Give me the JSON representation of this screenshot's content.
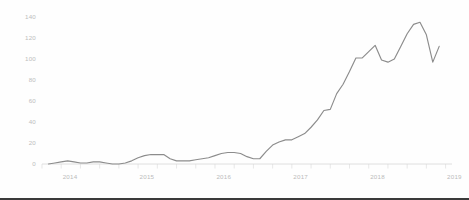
{
  "chart_data": {
    "type": "line",
    "title": "",
    "subtitle": "",
    "xlabel": "",
    "ylabel": "",
    "grid": false,
    "legend": null,
    "legend_position": "none",
    "line_color": "#8c8c8c",
    "axis_color": "#d8d8d8",
    "label_color": "#bdbdbd",
    "background_color": "#fefefe",
    "ylim": [
      0,
      145
    ],
    "ytick_values": [
      0,
      20,
      40,
      60,
      80,
      100,
      120,
      140
    ],
    "ytick_labels": [
      "0",
      "20",
      "40",
      "60",
      "80",
      "100",
      "120",
      "140"
    ],
    "xlim": [
      "2013-10",
      "2019-02"
    ],
    "xtick_labels": [
      "2014",
      "2015",
      "2016",
      "2017",
      "2018",
      "2019"
    ],
    "xtick_x": [
      "2014-01",
      "2015-01",
      "2016-01",
      "2017-01",
      "2018-01",
      "2019-01"
    ],
    "minor_tick_interval_months": 3,
    "x": [
      "2013-11",
      "2013-12",
      "2014-01",
      "2014-02",
      "2014-03",
      "2014-04",
      "2014-05",
      "2014-06",
      "2014-07",
      "2014-08",
      "2014-09",
      "2014-10",
      "2014-11",
      "2014-12",
      "2015-01",
      "2015-02",
      "2015-03",
      "2015-04",
      "2015-05",
      "2015-06",
      "2015-07",
      "2015-08",
      "2015-09",
      "2015-10",
      "2015-11",
      "2015-12",
      "2016-01",
      "2016-02",
      "2016-03",
      "2016-04",
      "2016-05",
      "2016-06",
      "2016-07",
      "2016-08",
      "2016-09",
      "2016-10",
      "2016-11",
      "2016-12",
      "2017-01",
      "2017-02",
      "2017-03",
      "2017-04",
      "2017-05",
      "2017-06",
      "2017-07",
      "2017-08",
      "2017-09",
      "2017-10",
      "2017-11",
      "2017-12",
      "2018-01",
      "2018-02",
      "2018-03",
      "2018-04",
      "2018-05",
      "2018-06",
      "2018-07",
      "2018-08",
      "2018-09",
      "2018-10",
      "2018-11",
      "2018-12"
    ],
    "values": [
      0,
      1,
      2,
      3,
      2,
      1,
      1,
      2,
      2,
      1,
      0,
      0,
      1,
      3,
      6,
      8,
      9,
      9,
      9,
      5,
      3,
      3,
      3,
      4,
      5,
      6,
      8,
      10,
      11,
      11,
      10,
      7,
      5,
      5,
      12,
      18,
      21,
      23,
      23,
      26,
      29,
      35,
      42,
      51,
      52,
      67,
      76,
      88,
      101,
      101,
      107,
      113,
      99,
      97,
      100,
      112,
      124,
      133,
      135,
      123,
      97,
      112
    ],
    "series": [
      {
        "name": "series-1",
        "color": "#8c8c8c",
        "values": [
          0,
          1,
          2,
          3,
          2,
          1,
          1,
          2,
          2,
          1,
          0,
          0,
          1,
          3,
          6,
          8,
          9,
          9,
          9,
          5,
          3,
          3,
          3,
          4,
          5,
          6,
          8,
          10,
          11,
          11,
          10,
          7,
          5,
          5,
          12,
          18,
          21,
          23,
          23,
          26,
          29,
          35,
          42,
          51,
          52,
          67,
          76,
          88,
          101,
          101,
          107,
          113,
          99,
          97,
          100,
          112,
          124,
          133,
          135,
          123,
          97,
          112
        ]
      }
    ]
  }
}
